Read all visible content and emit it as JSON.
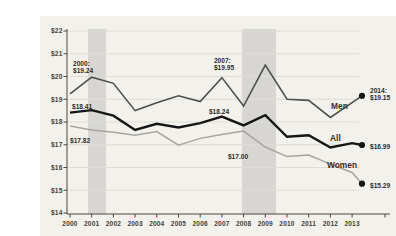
{
  "chart_data": {
    "type": "line",
    "title": "",
    "xlabel": "",
    "ylabel": "",
    "x_years": [
      2000,
      2001,
      2002,
      2003,
      2004,
      2005,
      2006,
      2007,
      2008,
      2009,
      2010,
      2011,
      2012,
      2013,
      2014
    ],
    "x_axis_tick_labels": [
      "2000",
      "2001",
      "2002",
      "2003",
      "2004",
      "2005",
      "2006",
      "2007",
      "2008",
      "2009",
      "2010",
      "2011",
      "2012",
      "2013"
    ],
    "ylim": [
      14,
      22
    ],
    "y_tick_prefix": "$",
    "grid": true,
    "series": [
      {
        "name": "Men",
        "color": "#4f4f4f",
        "stroke_width": 1.6,
        "end_dot": true,
        "values": [
          19.24,
          19.97,
          19.7,
          18.5,
          18.85,
          19.15,
          18.9,
          19.95,
          18.7,
          20.5,
          19.0,
          18.95,
          18.2,
          18.85,
          19.15
        ]
      },
      {
        "name": "All",
        "color": "#161616",
        "stroke_width": 2.4,
        "end_dot": true,
        "values": [
          18.41,
          18.52,
          18.28,
          17.65,
          17.92,
          17.76,
          17.95,
          18.24,
          17.85,
          18.3,
          17.35,
          17.42,
          16.88,
          17.07,
          16.99
        ]
      },
      {
        "name": "Women",
        "color": "#a7a5a0",
        "stroke_width": 1.5,
        "end_dot": true,
        "values": [
          17.82,
          17.65,
          17.55,
          17.42,
          17.58,
          16.98,
          17.28,
          17.45,
          17.6,
          16.9,
          16.48,
          16.55,
          16.15,
          15.78,
          15.29
        ]
      }
    ],
    "recession_bands": [
      {
        "from": 2000.83,
        "to": 2001.66
      },
      {
        "from": 2007.93,
        "to": 2009.49
      }
    ],
    "annotations": [
      {
        "id": "men-2000",
        "series": "Men",
        "year": 2000,
        "value": 19.24,
        "lines": [
          "2000:",
          "$19.24"
        ],
        "dx": 3,
        "dy": -34
      },
      {
        "id": "men-2007",
        "series": "Men",
        "year": 2007,
        "value": 19.95,
        "lines": [
          "2007:",
          "$19.95"
        ],
        "dx": -8,
        "dy": -21
      },
      {
        "id": "men-2014",
        "series": "Men",
        "year": 2014,
        "value": 19.15,
        "lines": [
          "2014:",
          "$19.15"
        ],
        "dx": 8,
        "dy": -9
      },
      {
        "id": "all-2000",
        "series": "All",
        "year": 2000,
        "value": 18.41,
        "lines": [
          "$18.41"
        ],
        "dx": 2,
        "dy": -10
      },
      {
        "id": "all-2007",
        "series": "All",
        "year": 2007,
        "value": 18.24,
        "lines": [
          "$18.24"
        ],
        "dx": -13,
        "dy": -9
      },
      {
        "id": "all-2014",
        "series": "All",
        "year": 2014,
        "value": 16.99,
        "lines": [
          "$16.99"
        ],
        "dx": 8,
        "dy": -2
      },
      {
        "id": "women-2000",
        "series": "Women",
        "year": 2000,
        "value": 17.82,
        "lines": [
          "$17.82"
        ],
        "dx": 0,
        "dy": 10
      },
      {
        "id": "women-2007",
        "series": "Women",
        "year": 2007,
        "value": 17.45,
        "lines": [
          "$17.00"
        ],
        "dx": 6,
        "dy": 18
      },
      {
        "id": "women-2014",
        "series": "Women",
        "year": 2014,
        "value": 15.29,
        "lines": [
          "$15.29"
        ],
        "dx": 8,
        "dy": -2
      }
    ],
    "series_labels": [
      {
        "text": "Men",
        "x": 291,
        "y": 93
      },
      {
        "text": "All",
        "x": 290,
        "y": 125
      },
      {
        "text": "Women",
        "x": 287,
        "y": 152
      }
    ]
  },
  "colors": {
    "background": "#f3f1eb",
    "gridline": "#deddd5",
    "recession_band": "#d7d6d2",
    "axis": "#4a4840",
    "tick_text": "#44423c",
    "annotation_text": "#2e2c28",
    "end_dot": "#161616"
  }
}
